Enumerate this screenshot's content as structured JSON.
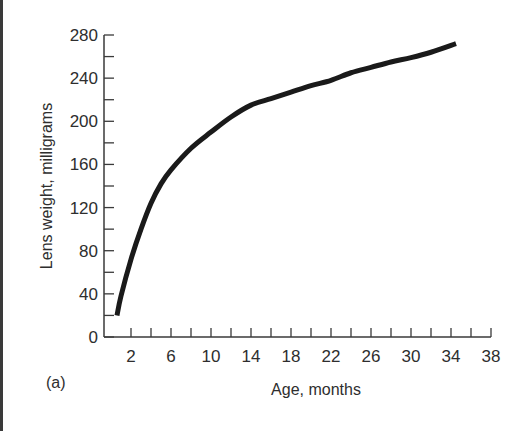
{
  "chart_data": {
    "type": "line",
    "title": "",
    "panel_label": "(a)",
    "xlabel": "Age, months",
    "ylabel": "Lens weight, milligrams",
    "xlim": [
      0,
      38
    ],
    "ylim": [
      0,
      280
    ],
    "x_ticks": [
      2,
      6,
      10,
      14,
      18,
      22,
      26,
      30,
      34,
      38
    ],
    "x_minor_ticks_step": 2,
    "y_ticks": [
      0,
      40,
      80,
      120,
      160,
      200,
      240,
      280
    ],
    "y_minor_ticks_step": 20,
    "grid": false,
    "legend": null,
    "series": [
      {
        "name": "Lens weight",
        "color": "#1a1a1a",
        "x": [
          0.6,
          1,
          2,
          3,
          4,
          5,
          6,
          8,
          10,
          12,
          14,
          16,
          18,
          20,
          22,
          24,
          26,
          28,
          30,
          32,
          34.5
        ],
        "y": [
          20,
          38,
          72,
          100,
          124,
          142,
          155,
          175,
          190,
          204,
          215,
          221,
          227,
          233,
          238,
          245,
          250,
          255,
          259,
          264,
          272
        ]
      }
    ]
  }
}
